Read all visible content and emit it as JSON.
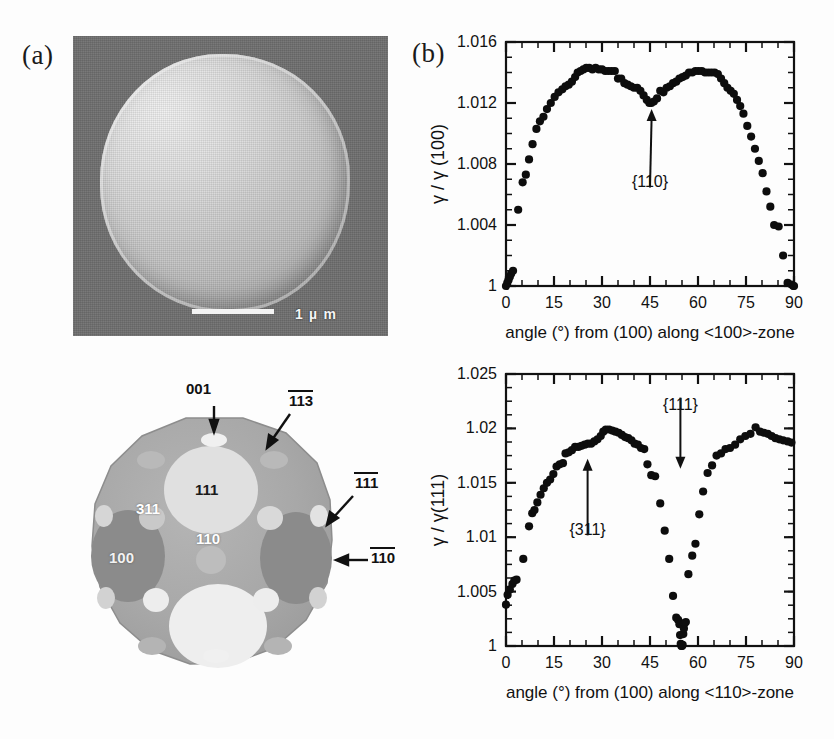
{
  "figure": {
    "panel_a_label": "(a)",
    "panel_b_label": "(b)"
  },
  "micrograph": {
    "scalebar_text": "1 µ m",
    "icon": "sem-particle-icon"
  },
  "crystal_diagram": {
    "pointer_labels": [
      {
        "text": "001",
        "overbar": false
      },
      {
        "text": "113",
        "overbar": true
      },
      {
        "text": "111",
        "overbar": true
      },
      {
        "text": "110",
        "overbar": true
      }
    ],
    "face_labels": [
      "111",
      "311",
      "110",
      "100"
    ]
  },
  "chart_data": [
    {
      "id": "gamma-100-zone",
      "type": "scatter",
      "title": "",
      "xlabel": "angle (°) from (100) along <100>-zone",
      "ylabel": "γ / γ (100)",
      "xlim": [
        0,
        90
      ],
      "ylim": [
        1,
        1.016
      ],
      "xticks": [
        0,
        15,
        30,
        45,
        60,
        75,
        90
      ],
      "xticklabels": [
        "0",
        "15",
        "30",
        "45",
        "60",
        "75",
        "90"
      ],
      "yticks": [
        1,
        1.004,
        1.008,
        1.012,
        1.016
      ],
      "yticklabels": [
        "1",
        "1.004",
        "1.008",
        "1.012",
        "1.016"
      ],
      "minor_xtick_step": 5,
      "minor_ytick_step": 0.001,
      "grid": false,
      "legend": "none",
      "annotations": [
        {
          "text": "{110}",
          "x": 45,
          "y": 1.0062,
          "arrow_to_x": 45.5,
          "arrow_to_y": 1.0116
        }
      ],
      "x": [
        0.0,
        0.4,
        0.8,
        1.2,
        1.6,
        2.2,
        3.8,
        5.2,
        6.2,
        7.2,
        8.3,
        9.5,
        10.6,
        11.7,
        12.8,
        14.0,
        15.2,
        16.4,
        17.6,
        18.6,
        19.6,
        20.6,
        21.6,
        22.4,
        23.3,
        24.2,
        25.1,
        26.0,
        27.0,
        28.0,
        29.0,
        30.0,
        31.0,
        32.0,
        33.0,
        34.0,
        35.0,
        36.0,
        37.0,
        38.0,
        39.0,
        40.0,
        41.0,
        42.0,
        43.0,
        44.0,
        44.8,
        45.4,
        46.2,
        47.2,
        48.2,
        49.2,
        50.2,
        51.2,
        52.2,
        53.2,
        54.2,
        55.2,
        56.2,
        57.2,
        58.2,
        59.2,
        60.2,
        61.2,
        62.2,
        63.2,
        64.2,
        65.2,
        66.2,
        67.2,
        68.2,
        69.2,
        70.2,
        71.2,
        72.2,
        73.2,
        74.2,
        75.4,
        76.6,
        77.8,
        79.0,
        80.2,
        81.4,
        82.6,
        83.8,
        85.2,
        86.6,
        88.0,
        89.2,
        89.8,
        90.0
      ],
      "y": [
        1.0,
        1.0002,
        1.0004,
        1.0006,
        1.0008,
        1.001,
        1.005,
        1.0068,
        1.0073,
        1.0083,
        1.0093,
        1.0103,
        1.0108,
        1.0111,
        1.0116,
        1.012,
        1.0124,
        1.0127,
        1.0129,
        1.0131,
        1.0132,
        1.0134,
        1.0137,
        1.014,
        1.0141,
        1.0142,
        1.0143,
        1.0143,
        1.0142,
        1.0143,
        1.0142,
        1.0142,
        1.0141,
        1.0141,
        1.0141,
        1.0141,
        1.0136,
        1.0136,
        1.0133,
        1.0132,
        1.0131,
        1.013,
        1.013,
        1.0128,
        1.0125,
        1.0122,
        1.012,
        1.012,
        1.0121,
        1.0123,
        1.0128,
        1.0127,
        1.013,
        1.0131,
        1.0133,
        1.0134,
        1.0136,
        1.0137,
        1.0138,
        1.014,
        1.014,
        1.0141,
        1.0141,
        1.0141,
        1.014,
        1.014,
        1.014,
        1.014,
        1.0139,
        1.0136,
        1.0133,
        1.013,
        1.0128,
        1.0126,
        1.0122,
        1.0118,
        1.0113,
        1.0105,
        1.0098,
        1.009,
        1.0082,
        1.0074,
        1.0062,
        1.0052,
        1.004,
        1.0039,
        1.002,
        1.0002,
        1.0001,
        1.0,
        1.0
      ]
    },
    {
      "id": "gamma-111-zone",
      "type": "scatter",
      "title": "",
      "xlabel": "angle (°) from (100) along <110>-zone",
      "ylabel": "γ / γ(111)",
      "xlim": [
        0,
        90
      ],
      "ylim": [
        1,
        1.025
      ],
      "xticks": [
        0,
        15,
        30,
        45,
        60,
        75,
        90
      ],
      "xticklabels": [
        "0",
        "15",
        "30",
        "45",
        "60",
        "75",
        "90"
      ],
      "yticks": [
        1,
        1.005,
        1.01,
        1.015,
        1.02,
        1.025
      ],
      "yticklabels": [
        "1",
        "1.005",
        "1.01",
        "1.015",
        "1.02",
        "1.025"
      ],
      "minor_xtick_step": 5,
      "minor_ytick_step": 0.00125,
      "grid": false,
      "legend": "none",
      "annotations": [
        {
          "text": "{311}",
          "x": 25.5,
          "y": 1.0098,
          "arrow_to_x": 25.5,
          "arrow_to_y": 1.0172
        },
        {
          "text": "{111}",
          "x": 54.5,
          "y": 1.0232,
          "arrow_to_x": 54.5,
          "arrow_to_y": 1.0163
        }
      ],
      "x": [
        0.0,
        0.5,
        1.2,
        2.0,
        2.6,
        3.3,
        5.4,
        7.2,
        8.2,
        8.9,
        9.8,
        10.8,
        11.8,
        12.8,
        13.8,
        14.8,
        15.8,
        16.8,
        17.8,
        18.6,
        19.6,
        20.6,
        21.6,
        22.6,
        23.6,
        24.6,
        25.6,
        26.6,
        27.6,
        28.6,
        29.6,
        30.4,
        31.2,
        32.2,
        33.2,
        34.2,
        35.2,
        36.2,
        37.2,
        38.2,
        39.2,
        40.2,
        41.2,
        42.2,
        43.2,
        44.2,
        45.4,
        46.6,
        48.2,
        49.6,
        51.0,
        52.2,
        53.2,
        53.8,
        54.2,
        54.4,
        54.6,
        54.8,
        55.0,
        55.2,
        55.4,
        55.6,
        55.8,
        56.2,
        57.0,
        58.2,
        59.2,
        60.4,
        61.6,
        63.0,
        64.4,
        65.8,
        67.2,
        68.6,
        70.0,
        71.6,
        73.2,
        74.8,
        76.4,
        78.0,
        79.4,
        80.6,
        81.8,
        83.0,
        84.2,
        85.4,
        86.6,
        88.0,
        89.2
      ],
      "y": [
        1.0038,
        1.0047,
        1.0052,
        1.0057,
        1.006,
        1.0061,
        1.008,
        1.011,
        1.0122,
        1.0125,
        1.0132,
        1.0139,
        1.0145,
        1.015,
        1.0153,
        1.0158,
        1.0165,
        1.0167,
        1.0168,
        1.0177,
        1.0178,
        1.018,
        1.0183,
        1.0183,
        1.0184,
        1.0185,
        1.0186,
        1.0186,
        1.0188,
        1.019,
        1.0193,
        1.0197,
        1.0199,
        1.0199,
        1.0198,
        1.0197,
        1.0196,
        1.0194,
        1.0192,
        1.0191,
        1.0189,
        1.0186,
        1.0185,
        1.0182,
        1.0181,
        1.0167,
        1.0157,
        1.0156,
        1.0131,
        1.0106,
        1.008,
        1.0046,
        1.0026,
        1.0024,
        1.002,
        1.001,
        1.0002,
        1.0,
        1.0,
        1.0001,
        1.0011,
        1.0016,
        1.0021,
        1.0022,
        1.0066,
        1.0083,
        1.0094,
        1.0121,
        1.0142,
        1.0159,
        1.0166,
        1.0175,
        1.0177,
        1.0181,
        1.0182,
        1.0185,
        1.019,
        1.0193,
        1.0195,
        1.0201,
        1.0197,
        1.0196,
        1.0195,
        1.0193,
        1.0191,
        1.019,
        1.0189,
        1.0188,
        1.0187
      ]
    }
  ]
}
